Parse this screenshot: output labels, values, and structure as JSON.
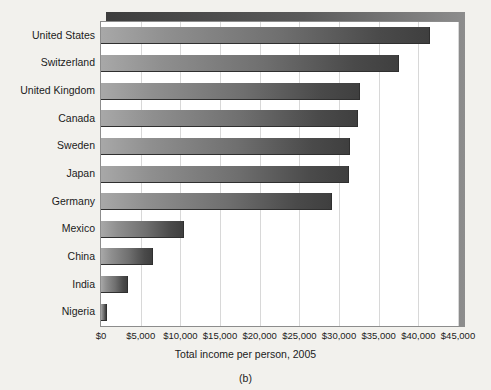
{
  "figure": {
    "panel_label": "(b)",
    "background_color": "#f2f1ed",
    "plot_background_color": "#ffffff",
    "frame_color": "#8c8c8c",
    "shadow_color": "#4d4d4d",
    "bar_gradient_start": "#a8a8a8",
    "bar_gradient_end": "#3f3f3f"
  },
  "chart_data": {
    "type": "bar",
    "orientation": "horizontal",
    "title": "",
    "xlabel": "Total income per person, 2005",
    "ylabel": "",
    "xlim": [
      0,
      45000
    ],
    "grid": true,
    "legend": null,
    "xticks": [
      0,
      5000,
      10000,
      15000,
      20000,
      25000,
      30000,
      35000,
      40000,
      45000
    ],
    "xtick_labels": [
      "$0",
      "$5,000",
      "$10,000",
      "$15,000",
      "$20,000",
      "$25,000",
      "$30,000",
      "$35,000",
      "$40,000",
      "$45,000"
    ],
    "categories": [
      "United States",
      "Switzerland",
      "United Kingdom",
      "Canada",
      "Sweden",
      "Japan",
      "Germany",
      "Mexico",
      "China",
      "India",
      "Nigeria"
    ],
    "values": [
      41500,
      37500,
      32600,
      32400,
      31400,
      31300,
      29100,
      10400,
      6500,
      3400,
      750
    ]
  }
}
